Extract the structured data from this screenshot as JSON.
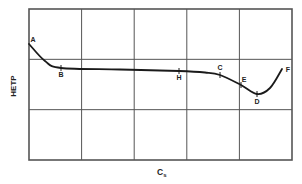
{
  "chart_data": {
    "type": "line",
    "title": "",
    "xlabel": "C",
    "xlabel_subscript": "s",
    "ylabel": "HETP",
    "grid": true,
    "grid_columns": 5,
    "grid_rows": 3,
    "x_ticks": [],
    "y_ticks": [],
    "legend": null,
    "series": [
      {
        "name": "HETP vs Cs",
        "points_px": [
          {
            "x": 29,
            "y": 44
          },
          {
            "x": 45,
            "y": 61
          },
          {
            "x": 61,
            "y": 68
          },
          {
            "x": 120,
            "y": 69.5
          },
          {
            "x": 179,
            "y": 71
          },
          {
            "x": 205,
            "y": 72.5
          },
          {
            "x": 220,
            "y": 75
          },
          {
            "x": 241,
            "y": 85
          },
          {
            "x": 257,
            "y": 94
          },
          {
            "x": 270,
            "y": 88
          },
          {
            "x": 282,
            "y": 69
          }
        ]
      }
    ],
    "annotations": [
      {
        "label": "A",
        "x": 29,
        "y": 44,
        "label_x": 33,
        "label_y": 42
      },
      {
        "label": "B",
        "x": 61,
        "y": 68,
        "label_x": 61,
        "label_y": 77
      },
      {
        "label": "H",
        "x": 179,
        "y": 71,
        "label_x": 179,
        "label_y": 80
      },
      {
        "label": "C",
        "x": 220,
        "y": 75,
        "label_x": 220,
        "label_y": 70
      },
      {
        "label": "E",
        "x": 241,
        "y": 85,
        "label_x": 244,
        "label_y": 82
      },
      {
        "label": "D",
        "x": 257,
        "y": 94,
        "label_x": 257,
        "label_y": 104
      },
      {
        "label": "F",
        "x": 282,
        "y": 69,
        "label_x": 288,
        "label_y": 72
      }
    ],
    "frame": {
      "left": 29,
      "top": 9,
      "right": 292,
      "bottom": 160
    },
    "colors": {
      "frame": "#555555",
      "grid": "#555555",
      "curve": "#1a1a1a",
      "text": "#222222"
    }
  }
}
